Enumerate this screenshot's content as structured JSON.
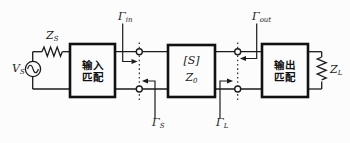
{
  "colors": {
    "line": "#1b1b1b",
    "box_border": "#111111",
    "background": "#fcfcfc"
  },
  "source": {
    "voltage_label": {
      "base": "V",
      "sub": "S"
    },
    "impedance_label": {
      "base": "Z",
      "sub": "S"
    }
  },
  "load": {
    "impedance_label": {
      "base": "Z",
      "sub": "L"
    }
  },
  "blocks": {
    "input_matching": {
      "line1": "输入",
      "line2": "匹配"
    },
    "s_network": {
      "matrix_label": "[S]",
      "impedance_label": {
        "base": "Z",
        "sub": "0"
      }
    },
    "output_matching": {
      "line1": "输出",
      "line2": "匹配"
    }
  },
  "reflection_coefficients": {
    "gamma_in": {
      "base": "Γ",
      "sub": "in"
    },
    "gamma_out": {
      "base": "Γ",
      "sub": "out"
    },
    "gamma_s": {
      "base": "Γ",
      "sub": "S"
    },
    "gamma_l": {
      "base": "Γ",
      "sub": "L"
    }
  }
}
